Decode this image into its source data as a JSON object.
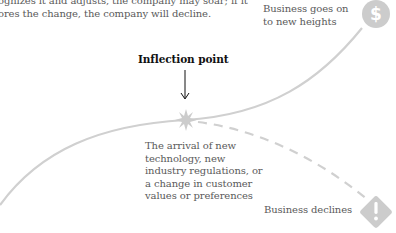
{
  "intro_text": {
    "line1": "ognizes it and adjusts, the company may soar; if it",
    "line2": "ores the change, the company will decline."
  },
  "outcome_up": {
    "line1": "Business goes on",
    "line2": "to new heights",
    "icon": "dollar-icon"
  },
  "inflection": {
    "title": "Inflection point",
    "description": [
      "The arrival of new",
      "technology, new",
      "industry regulations, or",
      "a change in customer",
      "values or preferences"
    ],
    "icon": "starburst-icon"
  },
  "outcome_down": {
    "label": "Business declines",
    "icon": "warning-icon"
  },
  "colors": {
    "curve": "#d0d0d0",
    "icon_fill": "#cccccc",
    "text": "#5a5a5a",
    "title": "#111111"
  }
}
